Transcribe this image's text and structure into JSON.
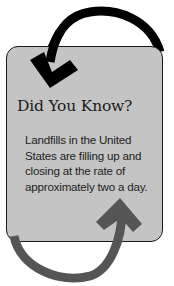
{
  "callout": {
    "title": "Did You Know?",
    "body": "Landfills in the United States are filling up and closing at the rate of approximately two a day."
  },
  "colors": {
    "card_background": "#c4c4c4",
    "card_border": "#1a1a1a",
    "top_arrow": "#000000",
    "bottom_arrow": "#555555"
  }
}
